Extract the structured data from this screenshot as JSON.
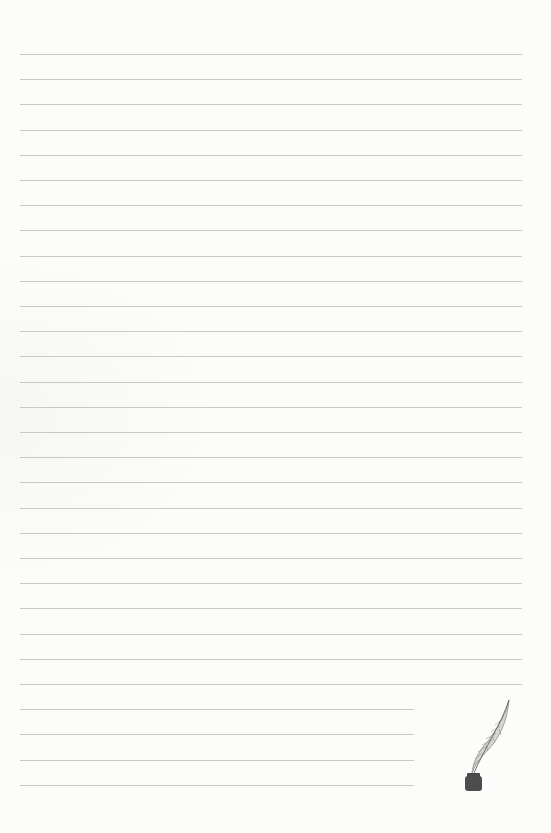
{
  "page": {
    "type": "lined-writing-paper",
    "background_color": "#fcfcfb",
    "line_color": "#c9c9c6",
    "line_count": 30,
    "first_line_y": 54,
    "line_spacing": 25.2,
    "line_left_x": 20,
    "full_line_right_x": 522,
    "short_line_right_x": 414,
    "short_line_count": 4
  },
  "decoration": {
    "icon": "quill-and-inkwell-icon",
    "ink_color": "#4a4a4a",
    "feather_color": "#9a9a9a"
  }
}
